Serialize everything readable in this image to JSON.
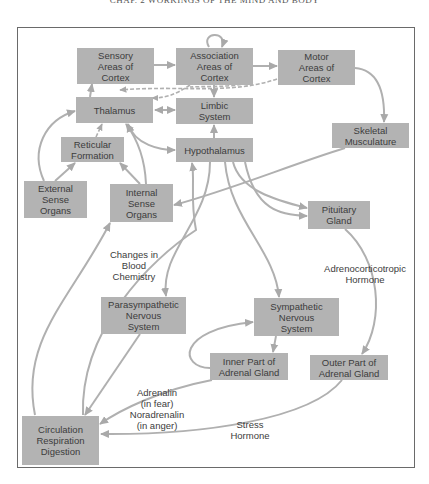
{
  "header": {
    "text": "CHAP. 2  WORKINGS OF THE MIND AND BODY"
  },
  "colors": {
    "box_fill": "#b3b3b3",
    "arrow": "#a9a9a9",
    "text": "#3c3c3c",
    "frame": "#6a6a6a"
  },
  "nodes": {
    "sensory_cortex": "Sensory\nAreas of\nCortex",
    "association_cortex": "Association\nAreas of\nCortex",
    "motor_cortex": "Motor\nAreas of\nCortex",
    "thalamus": "Thalamus",
    "limbic_system": "Limbic\nSystem",
    "skeletal_musculature": "Skeletal\nMusculature",
    "reticular_formation": "Reticular\nFormation",
    "hypothalamus": "Hypothalamus",
    "external_sense_organs": "External\nSense\nOrgans",
    "internal_sense_organs": "Internal\nSense\nOrgans",
    "pituitary_gland": "Pituitary\nGland",
    "parasympathetic": "Parasympathetic\nNervous\nSystem",
    "sympathetic": "Sympathetic\nNervous\nSystem",
    "inner_adrenal": "Inner Part of\nAdrenal Gland",
    "outer_adrenal": "Outer Part of\nAdrenal Gland",
    "circulation": "Circulation\nRespiration\nDigestion"
  },
  "edge_labels": {
    "blood_chemistry": "Changes in\nBlood\nChemistry",
    "acth": "Adrenocorticotropic\nHormone",
    "adrenalin": "Adrenalin\n(in fear)\nNoradrenalin\n(in anger)",
    "stress_hormone": "Stress\nHormone"
  }
}
